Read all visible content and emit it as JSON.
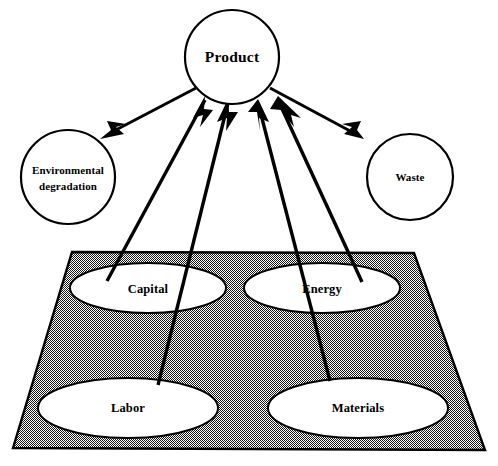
{
  "diagram": {
    "type": "flow-diagram",
    "background_color": "#ffffff",
    "line_color": "#000000",
    "fill_color": "#ffffff",
    "base_texture_color": "#4a4a4a",
    "nodes": {
      "product": {
        "label": "Product",
        "shape": "circle",
        "cx": 232,
        "cy": 57,
        "r": 47
      },
      "environmental_degradation": {
        "label_line1": "Environmental",
        "label_line2": "degradation",
        "shape": "circle",
        "cx": 68,
        "cy": 177,
        "r": 47
      },
      "waste": {
        "label": "Waste",
        "shape": "circle",
        "cx": 410,
        "cy": 177,
        "r": 43
      },
      "capital": {
        "label": "Capital",
        "shape": "ellipse",
        "cx": 148,
        "cy": 288,
        "rx": 78,
        "ry": 25
      },
      "energy": {
        "label": "Energy",
        "shape": "ellipse",
        "cx": 322,
        "cy": 288,
        "rx": 78,
        "ry": 25
      },
      "labor": {
        "label": "Labor",
        "shape": "ellipse",
        "cx": 128,
        "cy": 408,
        "rx": 90,
        "ry": 30
      },
      "materials": {
        "label": "Materials",
        "shape": "ellipse",
        "cx": 358,
        "cy": 408,
        "rx": 90,
        "ry": 30
      }
    },
    "base_plate": {
      "name": "production-base-plate",
      "points": "72,252 414,253 485,450 13,448",
      "pattern": "stippled-dither"
    },
    "arrows": [
      {
        "name": "product-to-environmental-degradation",
        "from": "product",
        "to": "environmental_degradation",
        "direction": "outflow"
      },
      {
        "name": "product-to-waste",
        "from": "product",
        "to": "waste",
        "direction": "outflow"
      },
      {
        "name": "capital-to-product",
        "from": "capital",
        "to": "product",
        "direction": "inflow"
      },
      {
        "name": "energy-to-product",
        "from": "energy",
        "to": "product",
        "direction": "inflow"
      },
      {
        "name": "labor-to-product",
        "from": "labor",
        "to": "product",
        "direction": "inflow"
      },
      {
        "name": "materials-to-product",
        "from": "materials",
        "to": "product",
        "direction": "inflow"
      }
    ]
  }
}
